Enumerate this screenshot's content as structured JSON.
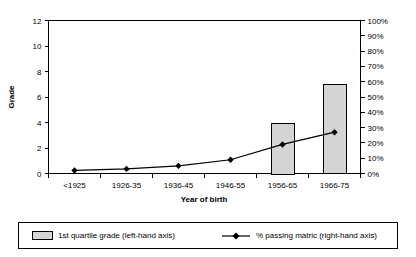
{
  "chart_data": {
    "type": "bar",
    "title": "",
    "xlabel": "Year of birth",
    "ylabel": "Grade",
    "y2label": "",
    "categories": [
      "<1925",
      "1926-35",
      "1936-45",
      "1946-55",
      "1956-65",
      "1966-75"
    ],
    "ylim": [
      0,
      12
    ],
    "y2lim": [
      0,
      100
    ],
    "yticks": [
      "0",
      "2",
      "4",
      "6",
      "8",
      "10",
      "12"
    ],
    "y2ticks": [
      "0%",
      "10%",
      "20%",
      "30%",
      "40%",
      "50%",
      "60%",
      "70%",
      "80%",
      "90%",
      "100%"
    ],
    "grid": false,
    "legend_position": "bottom",
    "series": [
      {
        "name": "1st quartile grade (left-hand axis)",
        "type": "bar",
        "axis": "left",
        "color": "#d4d4d4",
        "values": [
          0,
          0,
          0,
          0,
          4,
          7
        ]
      },
      {
        "name": "% passing matric (right-hand axis)",
        "type": "line",
        "axis": "right",
        "color": "#000000",
        "values": [
          2,
          3,
          5,
          9,
          19,
          27
        ]
      }
    ]
  },
  "legend": {
    "bar_entry_label": "1st quartile grade (left-hand axis)",
    "line_entry_label": "% passing matric (right-hand axis)"
  }
}
